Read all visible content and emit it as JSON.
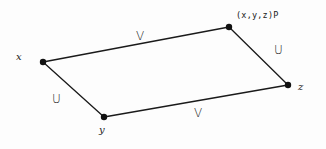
{
  "diagram": {
    "type": "parallelogram",
    "stroke_color": "#1a1a1a",
    "background": "#fdfdfd",
    "vertices": [
      {
        "id": "x",
        "label": "x",
        "cx": 43,
        "cy": 62
      },
      {
        "id": "y",
        "label": "y",
        "cx": 104,
        "cy": 117
      },
      {
        "id": "z",
        "label": "z",
        "cx": 288,
        "cy": 85
      },
      {
        "id": "p",
        "label": "(x,y,z)P",
        "cx": 229,
        "cy": 27
      }
    ],
    "edges": [
      {
        "id": "x-p",
        "from": "x",
        "to": "p",
        "label": "V"
      },
      {
        "id": "x-y",
        "from": "x",
        "to": "y",
        "label": "U"
      },
      {
        "id": "y-z",
        "from": "y",
        "to": "z",
        "label": "V"
      },
      {
        "id": "p-z",
        "from": "p",
        "to": "z",
        "label": "U"
      }
    ]
  }
}
